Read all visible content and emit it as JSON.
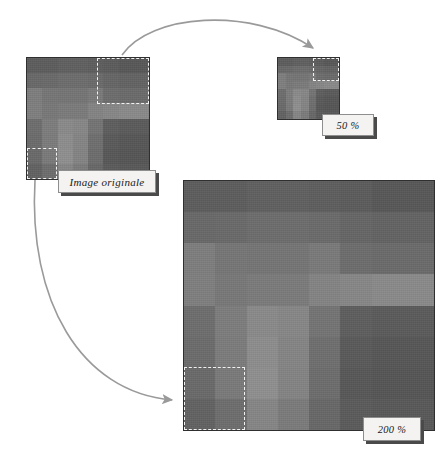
{
  "figure": {
    "background_color": "#ffffff",
    "ink_color": "#9a9a9a",
    "border_color": "#2f2f2f",
    "marquee_color": "#f2f2f2"
  },
  "labels": {
    "original": "Image originale",
    "half": "50 %",
    "double": "200 %"
  },
  "panels": [
    {
      "name": "original",
      "label": "Image originale",
      "zoom_percent": 100,
      "x": 26,
      "y": 57,
      "width": 122,
      "height": 121,
      "marquees": [
        {
          "name": "top-right-selection",
          "x": 70,
          "y": 0,
          "width": 52,
          "height": 46
        },
        {
          "name": "bottom-left-selection",
          "x": 0,
          "y": 90,
          "width": 30,
          "height": 31
        }
      ]
    },
    {
      "name": "reduced",
      "label": "50 %",
      "zoom_percent": 50,
      "x": 277,
      "y": 57,
      "width": 61,
      "height": 61,
      "marquees": [
        {
          "name": "top-right-selection",
          "x": 35,
          "y": 0,
          "width": 26,
          "height": 23
        }
      ]
    },
    {
      "name": "enlarged",
      "label": "200 %",
      "zoom_percent": 200,
      "x": 183,
      "y": 180,
      "width": 250,
      "height": 249,
      "marquees": [
        {
          "name": "bottom-left-selection",
          "x": 0,
          "y": 186,
          "width": 61,
          "height": 63
        }
      ]
    }
  ],
  "pixel_matrix": {
    "rows": 8,
    "cols": 8,
    "description": "8x8 grayscale blocks of the source raster, values are hex grays",
    "values": [
      [
        "#5d5d5d",
        "#5d5d5d",
        "#606060",
        "#606060",
        "#5e5e5e",
        "#5c5c5c",
        "#585858",
        "#585858"
      ],
      [
        "#696969",
        "#6a6a6a",
        "#6d6d6d",
        "#6d6d6d",
        "#6b6b6b",
        "#666666",
        "#636363",
        "#636363"
      ],
      [
        "#7e7e7e",
        "#767676",
        "#757575",
        "#757575",
        "#7a7a7a",
        "#6d6d6d",
        "#6b6b6b",
        "#6b6b6b"
      ],
      [
        "#7f7f7f",
        "#787878",
        "#7b7b7b",
        "#7b7b7b",
        "#848484",
        "#878787",
        "#8a8a8a",
        "#8a8a8a"
      ],
      [
        "#6e6e6e",
        "#7d7d7d",
        "#8a8a8a",
        "#878787",
        "#747474",
        "#5e5e5e",
        "#5b5b5b",
        "#5b5b5b"
      ],
      [
        "#6c6c6c",
        "#7c7c7c",
        "#8d8d8d",
        "#858585",
        "#6f6f6f",
        "#5a5a5a",
        "#575757",
        "#575757"
      ],
      [
        "#6a6a6a",
        "#7a7a7a",
        "#8f8f8f",
        "#848484",
        "#6d6d6d",
        "#585858",
        "#565656",
        "#565656"
      ],
      [
        "#626262",
        "#6e6e6e",
        "#868686",
        "#7b7b7b",
        "#686868",
        "#5b5b5b",
        "#595959",
        "#595959"
      ]
    ]
  },
  "label_boxes": [
    {
      "name": "original-label",
      "text": "Image originale",
      "x": 58,
      "y": 170,
      "width": 98,
      "height": 23
    },
    {
      "name": "half-label",
      "text": "50 %",
      "x": 322,
      "y": 114,
      "width": 52,
      "height": 22
    },
    {
      "name": "double-label",
      "text": "200 %",
      "x": 363,
      "y": 417,
      "width": 58,
      "height": 24
    }
  ],
  "arrows": [
    {
      "name": "arrow-to-reduced",
      "from_panel": "original",
      "to_panel": "reduced",
      "path": "M 122,55 C 150,14 250,6 313,48",
      "head_at": [
        313,
        48
      ]
    },
    {
      "name": "arrow-to-enlarged",
      "from_panel": "original",
      "to_panel": "enlarged",
      "path": "M 35,180 C 28,300 80,392 172,400",
      "head_at": [
        172,
        400
      ]
    }
  ]
}
